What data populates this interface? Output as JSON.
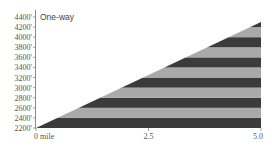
{
  "chart_data": {
    "type": "area",
    "title": "One-way",
    "xlabel": "",
    "ylabel": "",
    "x": [
      0,
      5.0
    ],
    "series": [
      {
        "name": "Elevation profile",
        "values": [
          2200,
          4300
        ]
      }
    ],
    "x_ticks": [
      {
        "value": 0,
        "label": "0 mile"
      },
      {
        "value": 2.5,
        "label": "2.5"
      },
      {
        "value": 5.0,
        "label": "5.0"
      }
    ],
    "y_ticks": [
      {
        "value": 2200,
        "label": "2200'"
      },
      {
        "value": 2400,
        "label": "2400'"
      },
      {
        "value": 2600,
        "label": "2600'"
      },
      {
        "value": 2800,
        "label": "2800'"
      },
      {
        "value": 3000,
        "label": "3000'"
      },
      {
        "value": 3200,
        "label": "3200'"
      },
      {
        "value": 3400,
        "label": "3400'"
      },
      {
        "value": 3600,
        "label": "3600'"
      },
      {
        "value": 3800,
        "label": "3800'"
      },
      {
        "value": 4000,
        "label": "4000'"
      },
      {
        "value": 4200,
        "label": "4200'"
      },
      {
        "value": 4400,
        "label": "4400'"
      }
    ],
    "xlim": [
      0,
      5.0
    ],
    "ylim": [
      2200,
      4400
    ],
    "band_interval": 200,
    "grid": false,
    "legend": "none",
    "colors": {
      "dark_band": "#3b3b3b",
      "light_band": "#a9a9a9",
      "axis": "#888888",
      "text": "#555555"
    }
  }
}
